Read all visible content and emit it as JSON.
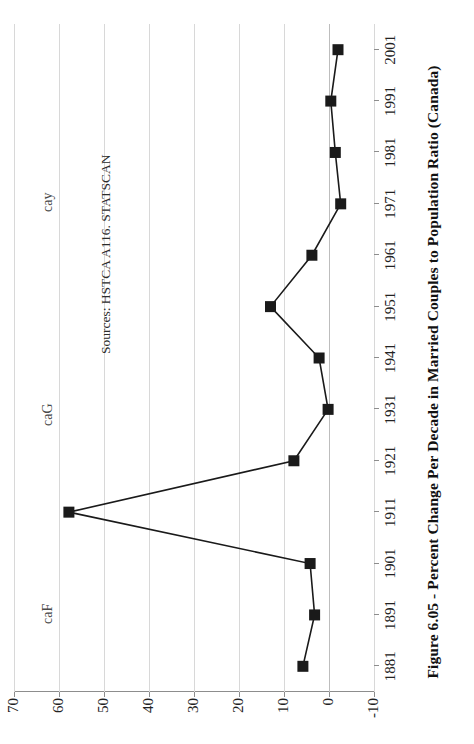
{
  "figure": {
    "caption": "Figure 6.05 - Percent Change Per Decade in Married Couples to Population Ratio (Canada)",
    "source_note": "Sources: HSTCA A116. STATSCAN",
    "watermarks": [
      {
        "text": "caF"
      },
      {
        "text": "caG"
      },
      {
        "text": "cay"
      }
    ]
  },
  "chart_data": {
    "type": "line",
    "title": "Figure 6.05 - Percent Change Per Decade in Married Couples to Population Ratio (Canada)",
    "xlabel": "",
    "ylabel": "",
    "categories": [
      "1881",
      "1891",
      "1901",
      "1911",
      "1921",
      "1931",
      "1941",
      "1951",
      "1961",
      "1971",
      "1981",
      "1991",
      "2001"
    ],
    "values": [
      5.8,
      3.2,
      4.2,
      57.8,
      7.8,
      0.2,
      2.2,
      13.0,
      3.8,
      -2.6,
      -1.4,
      -0.4,
      -2.0
    ],
    "series": [
      {
        "name": "Percent change per decade",
        "values": [
          5.8,
          3.2,
          4.2,
          57.8,
          7.8,
          0.2,
          2.2,
          13.0,
          3.8,
          -2.6,
          -1.4,
          -0.4,
          -2.0
        ]
      }
    ],
    "ylim": [
      -10,
      70
    ],
    "yticks": [
      70,
      60,
      50,
      40,
      30,
      20,
      10,
      0,
      -10
    ],
    "ytick_labels": [
      "70",
      "60",
      "50",
      "40",
      "30",
      "20",
      "10",
      "0",
      "-10"
    ],
    "grid": true,
    "legend": "none",
    "marker": "square",
    "annotations": [
      "Sources: HSTCA A116. STATSCAN",
      "caF",
      "caG",
      "cay"
    ]
  }
}
